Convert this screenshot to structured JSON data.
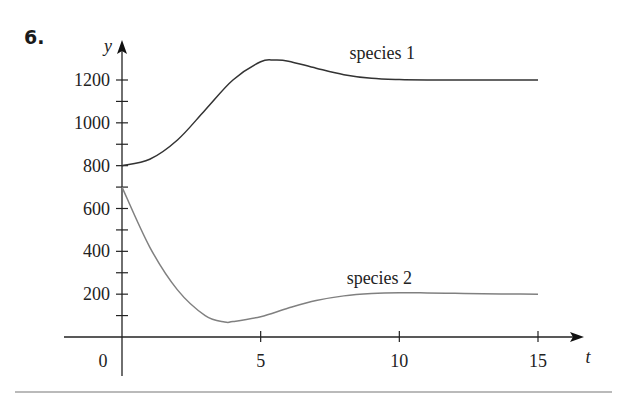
{
  "figure": {
    "number": "6."
  },
  "chart_data": {
    "type": "line",
    "title": "",
    "xlabel": "t",
    "ylabel": "y",
    "xlim": [
      0,
      15
    ],
    "ylim": [
      0,
      1300
    ],
    "x_ticks": [
      0,
      5,
      10,
      15
    ],
    "x_tick_labels": [
      "0",
      "5",
      "10",
      "15"
    ],
    "y_ticks": [
      200,
      400,
      600,
      800,
      1000,
      1200
    ],
    "y_tick_labels": [
      "200",
      "400",
      "600",
      "800",
      "1000",
      "1200"
    ],
    "y_minor_ticks": [
      100,
      300,
      500,
      700,
      900,
      1100
    ],
    "grid": false,
    "legend": "inline labels",
    "series": [
      {
        "name": "species 1",
        "color": "#333333",
        "x": [
          0,
          1,
          2,
          3,
          4,
          5,
          5.5,
          6,
          7,
          8,
          9,
          10,
          11,
          12,
          13,
          14,
          15
        ],
        "y": [
          800,
          830,
          920,
          1060,
          1200,
          1285,
          1293,
          1288,
          1255,
          1225,
          1208,
          1202,
          1200,
          1200,
          1200,
          1200,
          1200
        ]
      },
      {
        "name": "species 2",
        "color": "#808080",
        "x": [
          0,
          1,
          2,
          3,
          3.7,
          4,
          5,
          6,
          7,
          8,
          9,
          10,
          11,
          12,
          13,
          14,
          15
        ],
        "y": [
          700,
          420,
          220,
          100,
          70,
          72,
          95,
          135,
          170,
          192,
          203,
          207,
          206,
          204,
          202,
          201,
          200
        ]
      }
    ],
    "annotations": [
      {
        "text": "species 1",
        "x": 8.2,
        "y": 1320
      },
      {
        "text": "species 2",
        "x": 8.1,
        "y": 270
      }
    ]
  },
  "labels": {
    "y_axis": "y",
    "x_axis": "t",
    "origin": "0",
    "species1": "species 1",
    "species2": "species 2"
  }
}
